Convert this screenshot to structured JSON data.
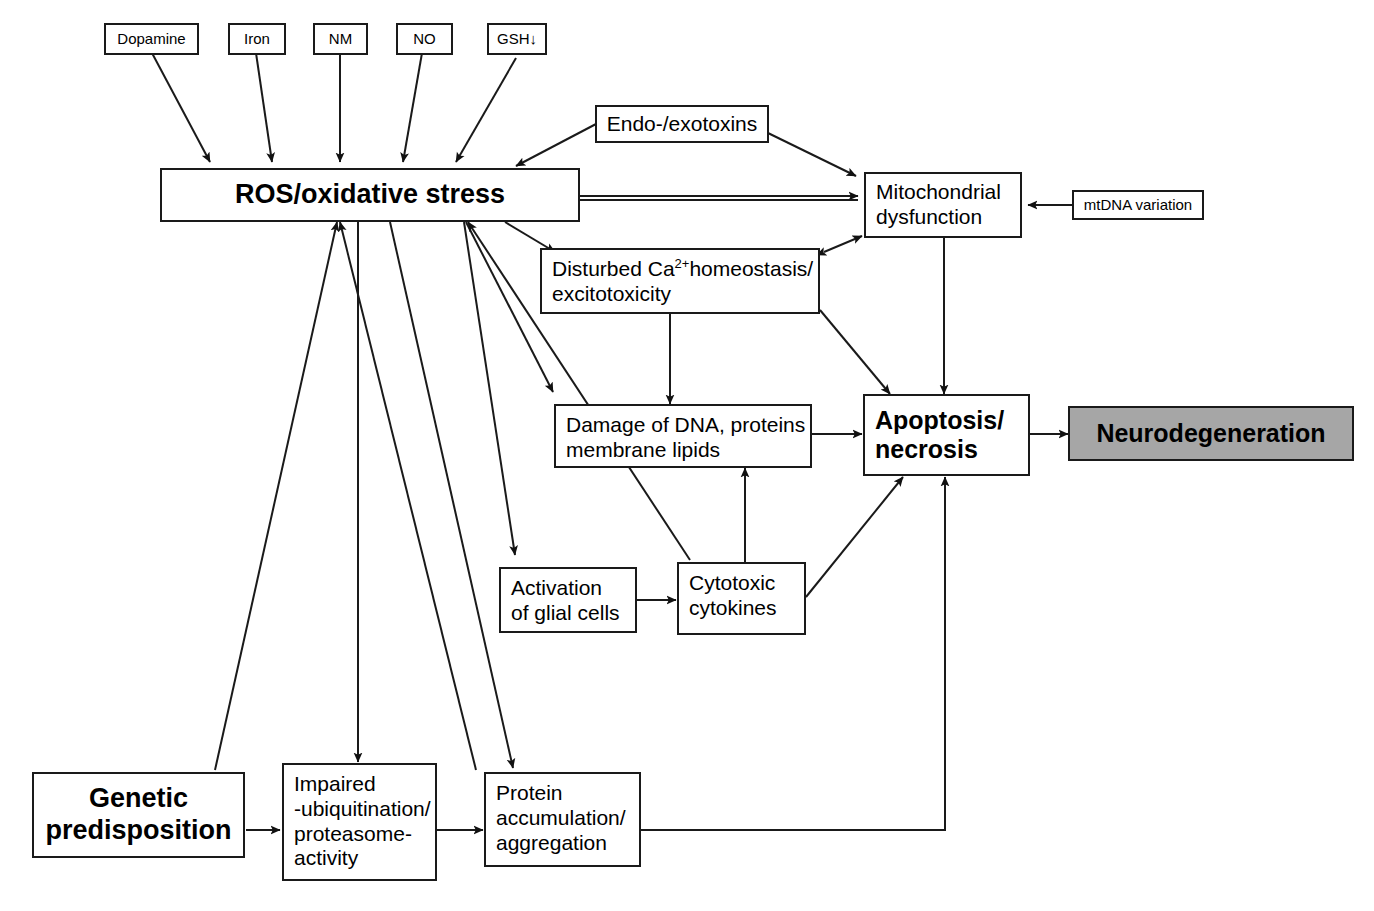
{
  "figure": {
    "type": "flow-diagram",
    "background_color": "#ffffff",
    "stroke_color": "#1a1a1a",
    "highlight_fill": "#a6a6a6"
  },
  "nodes": {
    "dopamine": "Dopamine",
    "iron": "Iron",
    "nm": "NM",
    "no": "NO",
    "gsh": "GSH↓",
    "endoexotoxins": "Endo-/exotoxins",
    "ros": "ROS/oxidative stress",
    "mitochondrial": "Mitochondrial\ndysfunction",
    "mtdna": "mtDNA variation",
    "calcium_line1_a": "Disturbed Ca",
    "calcium_sup": "2+",
    "calcium_line1_b": "homeostasis/",
    "calcium_line2": "excitotoxicity",
    "damage": "Damage of DNA, proteins\nmembrane lipids",
    "apoptosis": "Apoptosis/\nnecrosis",
    "neurodegeneration": "Neurodegeneration",
    "glial": "Activation\nof glial cells",
    "cytokines": "Cytotoxic\ncytokines",
    "genetic": "Genetic\npredisposition",
    "ubiquitination": "Impaired\n-ubiquitination/\nproteasome-\nactivity",
    "protein": "Protein\naccumulation/\naggregation"
  },
  "edges": [
    {
      "from": "dopamine",
      "to": "ros",
      "style": "arrow"
    },
    {
      "from": "iron",
      "to": "ros",
      "style": "arrow"
    },
    {
      "from": "nm",
      "to": "ros",
      "style": "arrow"
    },
    {
      "from": "no",
      "to": "ros",
      "style": "arrow"
    },
    {
      "from": "gsh",
      "to": "ros",
      "style": "arrow"
    },
    {
      "from": "endoexotoxins",
      "to": "ros",
      "style": "arrow"
    },
    {
      "from": "endoexotoxins",
      "to": "mitochondrial",
      "style": "arrow"
    },
    {
      "from": "ros",
      "to": "mitochondrial",
      "style": "arrow"
    },
    {
      "from": "mitochondrial",
      "to": "ros",
      "style": "arrow"
    },
    {
      "from": "mtdna",
      "to": "mitochondrial",
      "style": "arrow"
    },
    {
      "from": "ros",
      "to": "calcium",
      "style": "arrow"
    },
    {
      "from": "calcium",
      "to": "mitochondrial",
      "style": "double-arrow"
    },
    {
      "from": "calcium",
      "to": "damage",
      "style": "arrow"
    },
    {
      "from": "calcium",
      "to": "apoptosis",
      "style": "arrow"
    },
    {
      "from": "mitochondrial",
      "to": "apoptosis",
      "style": "arrow"
    },
    {
      "from": "ros",
      "to": "damage",
      "style": "arrow"
    },
    {
      "from": "ros",
      "to": "glial",
      "style": "arrow"
    },
    {
      "from": "damage",
      "to": "apoptosis",
      "style": "arrow"
    },
    {
      "from": "glial",
      "to": "cytokines",
      "style": "arrow"
    },
    {
      "from": "cytokines",
      "to": "damage",
      "style": "arrow"
    },
    {
      "from": "cytokines",
      "to": "apoptosis",
      "style": "arrow"
    },
    {
      "from": "cytokines",
      "to": "ros",
      "style": "arrow"
    },
    {
      "from": "apoptosis",
      "to": "neurodegeneration",
      "style": "arrow"
    },
    {
      "from": "genetic",
      "to": "ubiquitination",
      "style": "arrow"
    },
    {
      "from": "genetic",
      "to": "ros",
      "style": "arrow"
    },
    {
      "from": "ubiquitination",
      "to": "protein",
      "style": "arrow"
    },
    {
      "from": "ros",
      "to": "ubiquitination",
      "style": "arrow"
    },
    {
      "from": "ros",
      "to": "protein",
      "style": "arrow"
    },
    {
      "from": "protein",
      "to": "ros",
      "style": "arrow"
    },
    {
      "from": "protein",
      "to": "apoptosis",
      "style": "arrow"
    }
  ]
}
